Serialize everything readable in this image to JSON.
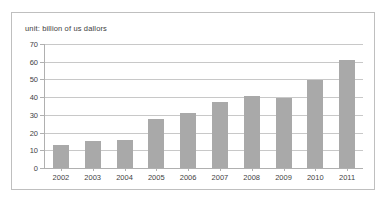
{
  "chart_data": {
    "type": "bar",
    "title": "unit: billion of us dallors",
    "xlabel": "",
    "ylabel": "",
    "ylim": [
      0,
      70
    ],
    "ytick_step": 10,
    "yticks": [
      "0",
      "10",
      "20",
      "30",
      "40",
      "50",
      "60",
      "70"
    ],
    "grid": true,
    "legend": null,
    "categories": [
      "2002",
      "2003",
      "2004",
      "2005",
      "2006",
      "2007",
      "2008",
      "2009",
      "2010",
      "2011"
    ],
    "values": [
      13,
      15.5,
      16,
      27.5,
      31,
      37,
      40.5,
      39.5,
      49.5,
      61
    ],
    "series": [
      {
        "name": "",
        "values": [
          13,
          15.5,
          16,
          27.5,
          31,
          37,
          40.5,
          39.5,
          49.5,
          61
        ]
      }
    ],
    "colors": {
      "bar": "#a9a9a9",
      "gridline": "#c8c8c8",
      "axis": "#b0b0b0",
      "frame_border": "#bfbfbf",
      "text": "#3f3f3f",
      "background": "#ffffff"
    }
  }
}
